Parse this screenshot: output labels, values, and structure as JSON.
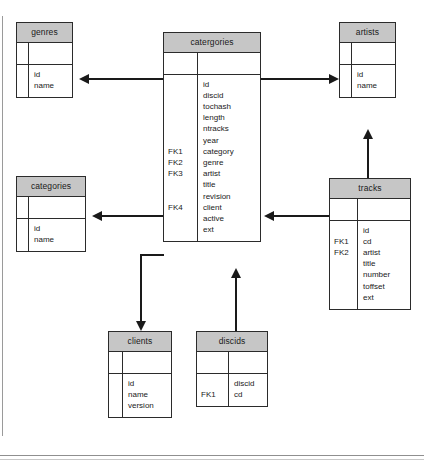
{
  "diagram": {
    "header_fill": "#c6c6c6",
    "line_color": "#1a1a1a",
    "background": "#ffffff"
  },
  "entities": {
    "genres": {
      "name": "genres",
      "keys": "",
      "fields": "id\nname"
    },
    "catergories": {
      "name": "catergories",
      "keys": "\n\n\n\n\n\nFK1\nFK2\nFK3\n\n\nFK4",
      "fields": "id\ndiscid\ntochash\nlength\nntracks\nyear\ncategory\ngenre\nartist\ntitle\nrevision\nclient\nactive\next"
    },
    "artists": {
      "name": "artists",
      "keys": "",
      "fields": "id\nname"
    },
    "categories": {
      "name": "categories",
      "keys": "",
      "fields": "id\nname"
    },
    "tracks": {
      "name": "tracks",
      "keys": "\nFK1\nFK2",
      "fields": "id\ncd\nartist\ntitle\nnumber\ntoffset\next"
    },
    "clients": {
      "name": "clients",
      "keys": "",
      "fields": "id\nname\nversion"
    },
    "discids": {
      "name": "discids",
      "keys": "\nFK1",
      "fields": "discid\ncd"
    }
  },
  "relationships": [
    {
      "id": "catergories-to-genres",
      "from": "catergories",
      "to": "genres",
      "direction": "left"
    },
    {
      "id": "catergories-to-artists",
      "from": "catergories",
      "to": "artists",
      "direction": "right"
    },
    {
      "id": "catergories-to-categories",
      "from": "catergories",
      "to": "categories",
      "direction": "left"
    },
    {
      "id": "catergories-to-clients",
      "from": "catergories",
      "to": "clients",
      "direction": "down"
    },
    {
      "id": "discids-to-catergories",
      "from": "discids",
      "to": "catergories",
      "direction": "up"
    },
    {
      "id": "tracks-to-artists",
      "from": "tracks",
      "to": "artists",
      "direction": "up"
    },
    {
      "id": "tracks-to-catergories",
      "from": "tracks",
      "to": "catergories",
      "direction": "left"
    }
  ]
}
